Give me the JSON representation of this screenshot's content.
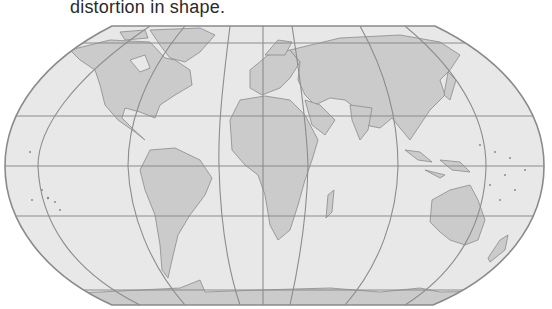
{
  "caption": "distortion in shape.",
  "map": {
    "projection": "Robinson-like pseudocylindrical world map",
    "colors": {
      "ocean": "#e8e8e8",
      "land": "#cbcbcb",
      "coast": "#8a8a8a",
      "graticule": "#8c8c8c",
      "outline": "#8a8a8a"
    },
    "continents": [
      "North America",
      "South America",
      "Europe",
      "Africa",
      "Asia",
      "Australia",
      "Antarctica",
      "Greenland"
    ]
  }
}
